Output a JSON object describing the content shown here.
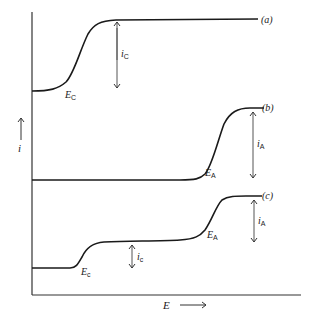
{
  "figure": {
    "type": "current-potential curves",
    "axes": {
      "y_label": "i",
      "x_label": "E"
    },
    "curves": [
      {
        "id": "a",
        "label": "(a)",
        "waves": [
          {
            "potential_label": "E",
            "potential_sub": "C",
            "current_label": "i",
            "current_sub": "C"
          }
        ]
      },
      {
        "id": "b",
        "label": "(b)",
        "waves": [
          {
            "potential_label": "E",
            "potential_sub": "A",
            "current_label": "i",
            "current_sub": "A"
          }
        ]
      },
      {
        "id": "c",
        "label": "(c)",
        "waves": [
          {
            "potential_label": "E",
            "potential_sub": "c",
            "current_label": "i",
            "current_sub": "c"
          },
          {
            "potential_label": "E",
            "potential_sub": "A",
            "current_label": "i",
            "current_sub": "A"
          }
        ]
      }
    ],
    "colors": {
      "ink": "#1a1a1a",
      "arrow": "#555555",
      "background": "#ffffff"
    }
  }
}
